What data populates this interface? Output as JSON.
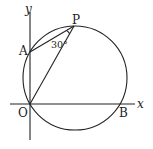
{
  "diagram": {
    "type": "geometry",
    "axes": {
      "x_label": "x",
      "y_label": "y"
    },
    "points": [
      {
        "name": "O",
        "label": "O"
      },
      {
        "name": "A",
        "label": "A"
      },
      {
        "name": "P",
        "label": "P"
      },
      {
        "name": "B",
        "label": "B"
      }
    ],
    "segments": [
      "AP",
      "OP"
    ],
    "circle_through": [
      "O",
      "A",
      "P",
      "B"
    ],
    "angle": {
      "vertex": "P",
      "between": [
        "A",
        "O"
      ],
      "label": "30°"
    },
    "color": "#222222"
  }
}
